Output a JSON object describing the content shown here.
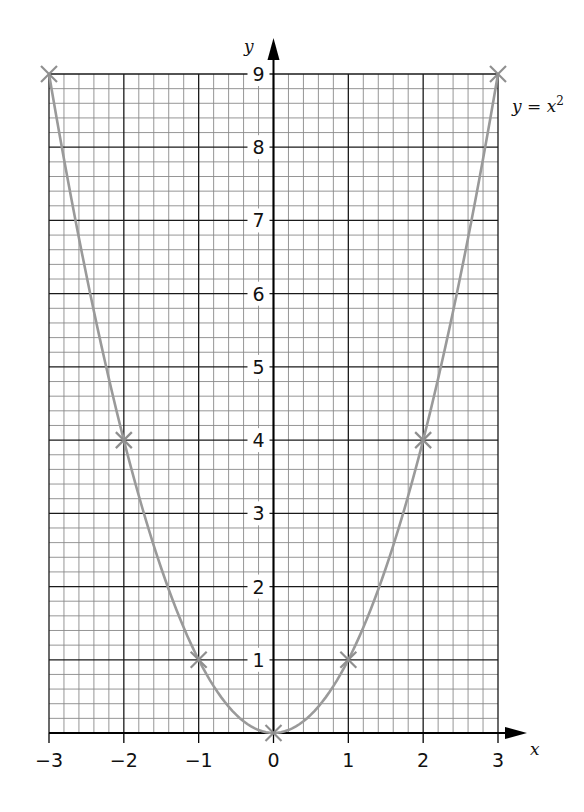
{
  "chart_data": {
    "type": "line",
    "title": "",
    "equation_label": "y = x²",
    "equation_parts": {
      "lhs": "y = x",
      "exponent": "2"
    },
    "xlabel": "x",
    "ylabel": "y",
    "xlim": [
      -3,
      3
    ],
    "ylim": [
      0,
      9
    ],
    "x_ticks": [
      -3,
      -2,
      -1,
      0,
      1,
      2,
      3
    ],
    "x_tick_labels": [
      "−3",
      "−2",
      "−1",
      "0",
      "1",
      "2",
      "3"
    ],
    "y_ticks": [
      1,
      2,
      3,
      4,
      5,
      6,
      7,
      8,
      9
    ],
    "y_tick_labels": [
      "1",
      "2",
      "3",
      "4",
      "5",
      "6",
      "7",
      "8",
      "9"
    ],
    "grid": {
      "on": true,
      "minor_divisions_per_unit": 5
    },
    "series": [
      {
        "name": "y = x^2",
        "x": [
          -3,
          -2,
          -1,
          0,
          1,
          2,
          3
        ],
        "y": [
          9,
          4,
          1,
          0,
          1,
          4,
          9
        ],
        "marker": "x",
        "curve": "smooth quadratic",
        "color": "#9a9a9a"
      }
    ],
    "legend": "inline label at top-right beside (3, 9)"
  },
  "colors": {
    "grid_minor": "#8a8a8a",
    "grid_major": "#1a1a1a",
    "curve": "#9a9a9a",
    "axis": "#000000"
  }
}
